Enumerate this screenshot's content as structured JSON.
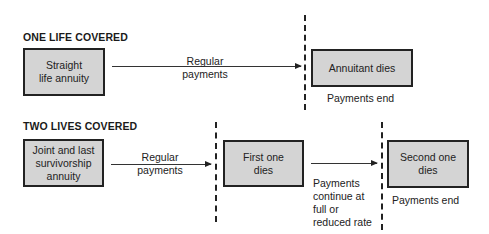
{
  "one_life": {
    "title": "ONE LIFE COVERED",
    "start_box": "Straight\nlife annuity",
    "arrow_label": "Regular\npayments",
    "end_box": "Annuitant dies",
    "end_note": "Payments end"
  },
  "two_lives": {
    "title": "TWO LIVES COVERED",
    "start_box": "Joint and last\nsurvivorship\nannuity",
    "arrow_label": "Regular\npayments",
    "middle_box": "First one\ndies",
    "middle_arrow_label": "Payments\ncontinue at\nfull or\nreduced rate",
    "end_box": "Second one\ndies",
    "end_note": "Payments end"
  },
  "colors": {
    "box_fill": "#d4d4d4",
    "line": "#222222"
  }
}
